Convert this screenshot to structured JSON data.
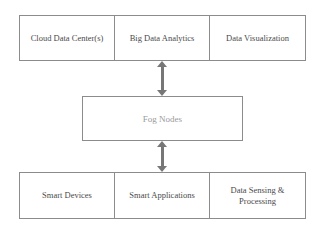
{
  "diagram": {
    "colors": {
      "border": "#8c8c8c",
      "text": "#4a4a4a",
      "fog_text": "#9a9a9a",
      "arrow": "#777777",
      "background": "#ffffff"
    },
    "tiers": [
      {
        "id": "cloud-tier",
        "cells": [
          {
            "label": "Cloud Data Center(s)"
          },
          {
            "label": "Big Data Analytics"
          },
          {
            "label": "Data Visualization"
          }
        ]
      },
      {
        "id": "fog-tier",
        "label": "Fog Nodes"
      },
      {
        "id": "edge-tier",
        "cells": [
          {
            "label": "Smart Devices"
          },
          {
            "label": "Smart Applications"
          },
          {
            "label": "Data Sensing & Processing"
          }
        ]
      }
    ],
    "connectors": [
      {
        "id": "cloud-fog",
        "type": "bidirectional-vertical-arrow"
      },
      {
        "id": "fog-edge",
        "type": "bidirectional-vertical-arrow"
      }
    ]
  }
}
